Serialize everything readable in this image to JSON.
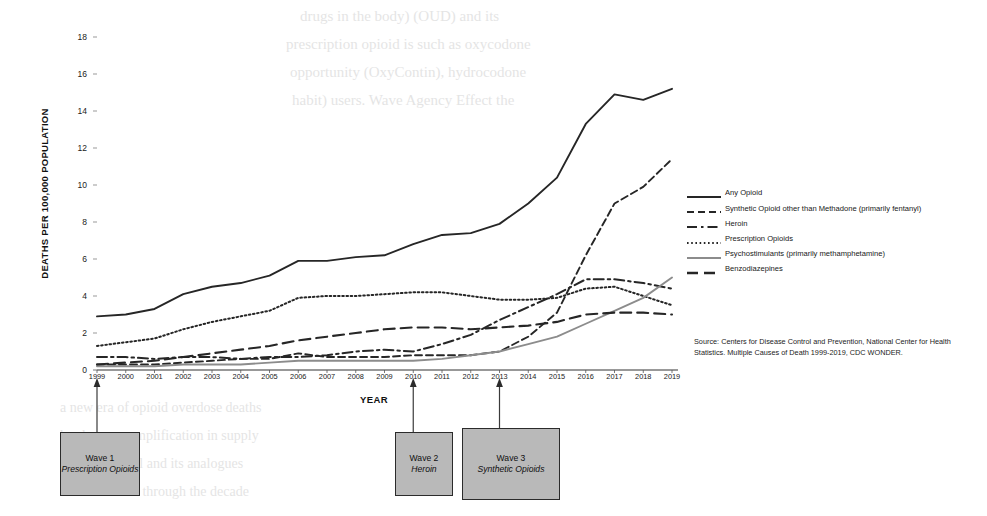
{
  "figure": {
    "y_axis_title": "DEATHS PER 100,000 POPULATION",
    "x_axis_title": "YEAR",
    "source_note": "Source: Centers for Disease Control and Prevention, National Center for Health Statistics. Multiple Causes of Death 1999-2019, CDC WONDER."
  },
  "annotations": [
    {
      "name": "wave-1",
      "title": "Wave 1",
      "subtitle": "Prescription Opioids",
      "points_to_year": 1999
    },
    {
      "name": "wave-2",
      "title": "Wave 2",
      "subtitle": "Heroin",
      "points_to_year": 2010
    },
    {
      "name": "wave-3",
      "title": "Wave 3",
      "subtitle": "Synthetic Opioids",
      "points_to_year": 2013
    }
  ],
  "bleed_text": [
    {
      "text": "drugs in the body) (OUD) and its",
      "x": 300,
      "y": 8,
      "size": 15
    },
    {
      "text": "prescription opioid is such as oxycodone",
      "x": 286,
      "y": 36,
      "size": 15
    },
    {
      "text": "opportunity (OxyContin), hydrocodone",
      "x": 290,
      "y": 64,
      "size": 15
    },
    {
      "text": "habit) users. Wave Agency Effect the",
      "x": 292,
      "y": 92,
      "size": 15
    },
    {
      "text": "a new era of opioid overdose deaths",
      "x": 60,
      "y": 400,
      "size": 14
    },
    {
      "text": "has been an amplification in supply",
      "x": 60,
      "y": 428,
      "size": 14
    },
    {
      "text": "that is fentanyl and its analogues",
      "x": 60,
      "y": 456,
      "size": 14
    },
    {
      "text": "continued rise through the decade",
      "x": 60,
      "y": 484,
      "size": 14
    }
  ],
  "chart_data": {
    "type": "line",
    "title": "",
    "xlabel": "YEAR",
    "ylabel": "DEATHS PER 100,000 POPULATION",
    "xlim": [
      1999,
      2019
    ],
    "ylim": [
      0,
      19
    ],
    "yticks": [
      0,
      2,
      4,
      6,
      8,
      10,
      12,
      14,
      16,
      18
    ],
    "grid": false,
    "legend_position": "right",
    "x": [
      1999,
      2000,
      2001,
      2002,
      2003,
      2004,
      2005,
      2006,
      2007,
      2008,
      2009,
      2010,
      2011,
      2012,
      2013,
      2014,
      2015,
      2016,
      2017,
      2018,
      2019
    ],
    "series": [
      {
        "name": "Any Opioid",
        "style": "solid",
        "color": "#262626",
        "values": [
          2.9,
          3.0,
          3.3,
          4.1,
          4.5,
          4.7,
          5.1,
          5.9,
          5.9,
          6.1,
          6.2,
          6.8,
          7.3,
          7.4,
          7.9,
          9.0,
          10.4,
          13.3,
          14.9,
          14.6,
          15.2
        ]
      },
      {
        "name": "Synthetic Opioid other than Methadone (primarily fentanyl)",
        "style": "dashed",
        "color": "#262626",
        "values": [
          0.3,
          0.3,
          0.3,
          0.4,
          0.5,
          0.6,
          0.6,
          0.9,
          0.7,
          0.7,
          0.7,
          0.8,
          0.8,
          0.8,
          1.0,
          1.8,
          3.1,
          6.2,
          9.0,
          9.9,
          11.4
        ]
      },
      {
        "name": "Heroin",
        "style": "dashdot",
        "color": "#262626",
        "values": [
          0.7,
          0.7,
          0.6,
          0.7,
          0.7,
          0.6,
          0.7,
          0.7,
          0.8,
          1.0,
          1.1,
          1.0,
          1.4,
          1.9,
          2.7,
          3.4,
          4.1,
          4.9,
          4.9,
          4.7,
          4.4
        ]
      },
      {
        "name": "Prescription Opioids",
        "style": "dotted",
        "color": "#262626",
        "values": [
          1.3,
          1.5,
          1.7,
          2.2,
          2.6,
          2.9,
          3.2,
          3.9,
          4.0,
          4.0,
          4.1,
          4.2,
          4.2,
          4.0,
          3.8,
          3.8,
          3.9,
          4.4,
          4.5,
          4.0,
          3.5
        ]
      },
      {
        "name": "Psychostimulants (primarily methamphetamine)",
        "style": "solid",
        "color": "#8c8c8c",
        "values": [
          0.2,
          0.2,
          0.2,
          0.3,
          0.3,
          0.3,
          0.4,
          0.5,
          0.5,
          0.5,
          0.5,
          0.5,
          0.6,
          0.8,
          1.0,
          1.4,
          1.8,
          2.5,
          3.2,
          3.9,
          5.0
        ]
      },
      {
        "name": "Benzodiazepines",
        "style": "longdash",
        "color": "#262626",
        "values": [
          0.3,
          0.4,
          0.5,
          0.7,
          0.9,
          1.1,
          1.3,
          1.6,
          1.8,
          2.0,
          2.2,
          2.3,
          2.3,
          2.2,
          2.3,
          2.4,
          2.6,
          3.0,
          3.1,
          3.1,
          3.0
        ]
      }
    ]
  }
}
